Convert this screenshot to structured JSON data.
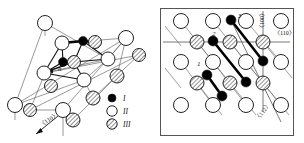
{
  "figure": {
    "type": "crystallographic-lattice-diagram",
    "background": "#ffffff",
    "line_color": "#3a3a3a",
    "bond_color": "#000000",
    "panels": [
      {
        "id": "left-panel",
        "name": "perspective-lattice-view",
        "framed": false,
        "labels": [
          {
            "name": "h-label",
            "text": "h",
            "x": 58,
            "y": 71,
            "italic": true,
            "size": 7
          },
          {
            "name": "direction-110-label",
            "text": "〈110〉",
            "x": 41,
            "y": 127,
            "rotate": -32,
            "size": 6
          }
        ],
        "arrows": [
          {
            "name": "direction-110-arrow",
            "x1": 58,
            "y1": 116,
            "x2": 34,
            "y2": 135
          }
        ]
      },
      {
        "id": "right-panel",
        "name": "projected-lattice-view",
        "framed": true,
        "frame": {
          "x": 160,
          "y": 8,
          "w": 133,
          "h": 127
        },
        "labels": [
          {
            "name": "defect-label-1",
            "text": "1",
            "x": 197,
            "y": 66,
            "italic": true,
            "size": 7
          },
          {
            "name": "defect-label-2",
            "text": "2",
            "x": 212,
            "y": 36,
            "italic": true,
            "size": 7
          },
          {
            "name": "defect-label-3",
            "text": "3",
            "x": 238,
            "y": 18,
            "italic": true,
            "size": 7
          },
          {
            "name": "direction-100-label",
            "text": "〈100〉",
            "x": 264,
            "y": 31,
            "rotate": -90,
            "size": 6
          },
          {
            "name": "direction-110-label",
            "text": "〈110〉",
            "x": 274,
            "y": 35,
            "rotate": 0,
            "size": 6
          },
          {
            "name": "direction-112-label",
            "text": "〈112〉",
            "x": 258,
            "y": 121,
            "rotate": -52,
            "size": 6
          }
        ]
      }
    ],
    "legend": {
      "name": "atom-type-legend",
      "x": 112,
      "y": 98,
      "entries": [
        {
          "name": "legend-item-I",
          "symbol": "filled-circle",
          "label": "I",
          "fill": "#000000"
        },
        {
          "name": "legend-item-II",
          "symbol": "open-circle",
          "label": "II",
          "fill": "#ffffff"
        },
        {
          "name": "legend-item-III",
          "symbol": "hatched-circle",
          "label": "III",
          "fill": "hatch"
        }
      ]
    },
    "atoms_left": [
      {
        "t": "open",
        "x": 45,
        "y": 23,
        "r": 7.5
      },
      {
        "t": "filled",
        "x": 83,
        "y": 41,
        "r": 4.5
      },
      {
        "t": "hatch",
        "x": 95,
        "y": 42,
        "r": 6.5
      },
      {
        "t": "open",
        "x": 62,
        "y": 43,
        "r": 7.0
      },
      {
        "t": "filled",
        "x": 63,
        "y": 62,
        "r": 4.5
      },
      {
        "t": "hatch",
        "x": 74,
        "y": 62,
        "r": 6.5
      },
      {
        "t": "open",
        "x": 108,
        "y": 59,
        "r": 7.0
      },
      {
        "t": "open",
        "x": 44,
        "y": 73,
        "r": 7.0
      },
      {
        "t": "hatch",
        "x": 51,
        "y": 86,
        "r": 6.5
      },
      {
        "t": "open",
        "x": 84,
        "y": 80,
        "r": 7.0
      },
      {
        "t": "open",
        "x": 126,
        "y": 38,
        "r": 7.5
      },
      {
        "t": "hatch",
        "x": 139,
        "y": 55,
        "r": 6.5
      },
      {
        "t": "hatch",
        "x": 117,
        "y": 76,
        "r": 7.0
      },
      {
        "t": "open",
        "x": 15,
        "y": 105,
        "r": 7.5
      },
      {
        "t": "hatch",
        "x": 30,
        "y": 110,
        "r": 6.5
      },
      {
        "t": "open",
        "x": 63,
        "y": 110,
        "r": 7.5
      },
      {
        "t": "hatch",
        "x": 73,
        "y": 120,
        "r": 7.0
      },
      {
        "t": "hatch",
        "x": 93,
        "y": 98,
        "r": 7.0
      }
    ],
    "atoms_right": [
      {
        "t": "open",
        "x": 181,
        "y": 21,
        "r": 7.5
      },
      {
        "t": "open",
        "x": 213,
        "y": 21,
        "r": 7.5
      },
      {
        "t": "filled",
        "x": 231,
        "y": 20,
        "r": 5.0
      },
      {
        "t": "open",
        "x": 246,
        "y": 21,
        "r": 7.5
      },
      {
        "t": "open",
        "x": 281,
        "y": 21,
        "r": 7.5
      },
      {
        "t": "hatch",
        "x": 197,
        "y": 42,
        "r": 7.0
      },
      {
        "t": "filled",
        "x": 213,
        "y": 41,
        "r": 5.0
      },
      {
        "t": "hatch",
        "x": 230,
        "y": 42,
        "r": 7.0
      },
      {
        "t": "hatch",
        "x": 263,
        "y": 42,
        "r": 7.0
      },
      {
        "t": "open",
        "x": 181,
        "y": 62,
        "r": 7.5
      },
      {
        "t": "open",
        "x": 213,
        "y": 62,
        "r": 7.5
      },
      {
        "t": "open",
        "x": 246,
        "y": 62,
        "r": 7.5
      },
      {
        "t": "filled",
        "x": 263,
        "y": 61,
        "r": 5.0
      },
      {
        "t": "open",
        "x": 281,
        "y": 62,
        "r": 7.5
      },
      {
        "t": "hatch",
        "x": 197,
        "y": 83,
        "r": 7.0
      },
      {
        "t": "filled",
        "x": 207,
        "y": 75,
        "r": 5.0
      },
      {
        "t": "hatch",
        "x": 230,
        "y": 83,
        "r": 7.0
      },
      {
        "t": "filled",
        "x": 246,
        "y": 82,
        "r": 5.0
      },
      {
        "t": "hatch",
        "x": 263,
        "y": 83,
        "r": 7.0
      },
      {
        "t": "filled",
        "x": 222,
        "y": 96,
        "r": 5.0
      },
      {
        "t": "open",
        "x": 181,
        "y": 105,
        "r": 7.5
      },
      {
        "t": "open",
        "x": 213,
        "y": 105,
        "r": 7.5
      },
      {
        "t": "open",
        "x": 246,
        "y": 105,
        "r": 7.5
      },
      {
        "t": "open",
        "x": 281,
        "y": 105,
        "r": 7.5
      }
    ],
    "bonds_right": [
      {
        "name": "dumbbell-1",
        "x1": 207,
        "y1": 75,
        "x2": 222,
        "y2": 96
      },
      {
        "name": "dumbbell-2",
        "x1": 213,
        "y1": 41,
        "x2": 246,
        "y2": 82
      },
      {
        "name": "dumbbell-3",
        "x1": 231,
        "y1": 20,
        "x2": 263,
        "y2": 61
      }
    ]
  }
}
